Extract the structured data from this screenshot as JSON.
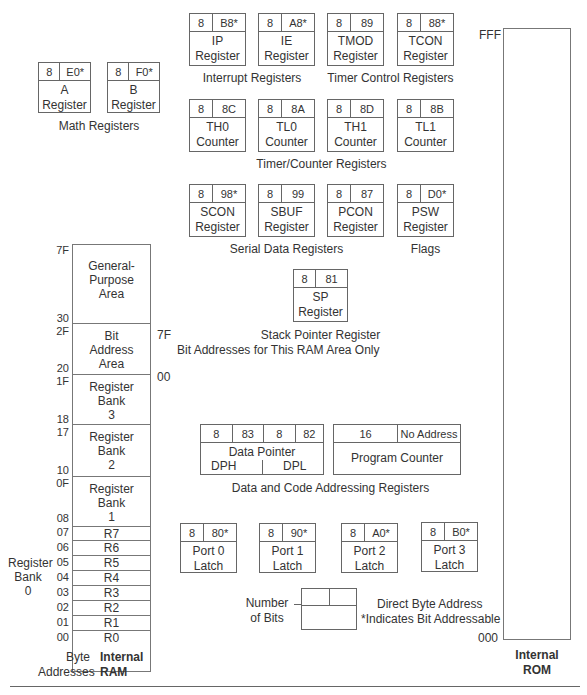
{
  "note": "*Indicates Bit Addressable",
  "math_registers": {
    "group_label": "Math Registers",
    "items": [
      {
        "bits": "8",
        "addr": "E0*",
        "name": "A",
        "sub": "Register"
      },
      {
        "bits": "8",
        "addr": "F0*",
        "name": "B",
        "sub": "Register"
      }
    ]
  },
  "interrupt_registers": {
    "group_label": "Interrupt Registers",
    "items": [
      {
        "bits": "8",
        "addr": "B8*",
        "name": "IP",
        "sub": "Register"
      },
      {
        "bits": "8",
        "addr": "A8*",
        "name": "IE",
        "sub": "Register"
      }
    ]
  },
  "timer_control_registers": {
    "group_label": "Timer Control Registers",
    "items": [
      {
        "bits": "8",
        "addr": "89",
        "name": "TMOD",
        "sub": "Register"
      },
      {
        "bits": "8",
        "addr": "88*",
        "name": "TCON",
        "sub": "Register"
      }
    ]
  },
  "timer_counter_registers": {
    "group_label": "Timer/Counter Registers",
    "items": [
      {
        "bits": "8",
        "addr": "8C",
        "name": "TH0",
        "sub": "Counter"
      },
      {
        "bits": "8",
        "addr": "8A",
        "name": "TL0",
        "sub": "Counter"
      },
      {
        "bits": "8",
        "addr": "8D",
        "name": "TH1",
        "sub": "Counter"
      },
      {
        "bits": "8",
        "addr": "8B",
        "name": "TL1",
        "sub": "Counter"
      }
    ]
  },
  "serial_data_registers": {
    "group_label": "Serial Data Registers",
    "items": [
      {
        "bits": "8",
        "addr": "98*",
        "name": "SCON",
        "sub": "Register"
      },
      {
        "bits": "8",
        "addr": "99",
        "name": "SBUF",
        "sub": "Register"
      },
      {
        "bits": "8",
        "addr": "87",
        "name": "PCON",
        "sub": "Register"
      }
    ]
  },
  "flags": {
    "group_label": "Flags",
    "item": {
      "bits": "8",
      "addr": "D0*",
      "name": "PSW",
      "sub": "Register"
    }
  },
  "stack_pointer": {
    "group_label": "Stack Pointer Register",
    "item": {
      "bits": "8",
      "addr": "81",
      "name": "SP",
      "sub": "Register"
    }
  },
  "bit_address_note": "Bit Addresses for This RAM Area Only",
  "bit_range": {
    "high": "7F",
    "low": "00"
  },
  "addressing_registers": {
    "group_label": "Data and Code Addressing Registers",
    "data_pointer": {
      "dph_bits": "8",
      "dph_addr": "83",
      "dpl_bits": "8",
      "dpl_addr": "82",
      "title": "Data Pointer",
      "dph": "DPH",
      "dpl": "DPL"
    },
    "program_counter": {
      "bits": "16",
      "addr": "No Address",
      "name": "Program Counter"
    }
  },
  "ports": [
    {
      "bits": "8",
      "addr": "80*",
      "name": "Port 0",
      "sub": "Latch"
    },
    {
      "bits": "8",
      "addr": "90*",
      "name": "Port 1",
      "sub": "Latch"
    },
    {
      "bits": "8",
      "addr": "A0*",
      "name": "Port 2",
      "sub": "Latch"
    },
    {
      "bits": "8",
      "addr": "B0*",
      "name": "Port 3",
      "sub": "Latch"
    }
  ],
  "legend": {
    "number_of_bits": "Number of Bits",
    "direct_byte_address": "Direct Byte Address",
    "bit_addressable": "*Indicates Bit Addressable"
  },
  "internal_ram": {
    "title_line1": "Internal",
    "title_line2": "RAM",
    "byte_addresses_line1": "Byte",
    "byte_addresses_line2": "Addresses",
    "bank0_label": [
      "Register",
      "Bank",
      "0"
    ],
    "areas": [
      {
        "hi": "7F",
        "lo": "30",
        "lines": [
          "General-",
          "Purpose",
          "Area"
        ]
      },
      {
        "hi": "2F",
        "lo": "20",
        "lines": [
          "Bit",
          "Address",
          "Area"
        ]
      },
      {
        "hi": "1F",
        "lo": "18",
        "lines": [
          "Register",
          "Bank",
          "3"
        ]
      },
      {
        "hi": "17",
        "lo": "10",
        "lines": [
          "Register",
          "Bank",
          "2"
        ]
      },
      {
        "hi": "0F",
        "lo": "08",
        "lines": [
          "Register",
          "Bank",
          "1"
        ]
      }
    ],
    "registers": [
      {
        "addr": "07",
        "name": "R7"
      },
      {
        "addr": "06",
        "name": "R6"
      },
      {
        "addr": "05",
        "name": "R5"
      },
      {
        "addr": "04",
        "name": "R4"
      },
      {
        "addr": "03",
        "name": "R3"
      },
      {
        "addr": "02",
        "name": "R2"
      },
      {
        "addr": "01",
        "name": "R1"
      },
      {
        "addr": "00",
        "name": "R0"
      }
    ]
  },
  "internal_rom": {
    "title_line1": "Internal",
    "title_line2": "ROM",
    "top_addr": "FFF",
    "bottom_addr": "000"
  }
}
